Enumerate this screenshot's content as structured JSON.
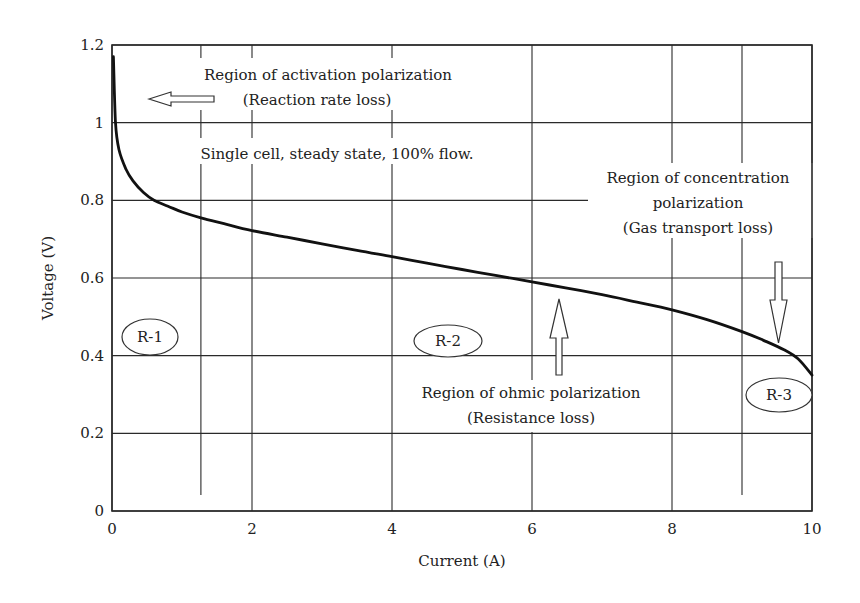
{
  "chart_data": {
    "type": "line",
    "title": "",
    "xlabel": "Current (A)",
    "ylabel": "Voltage (V)",
    "xlim": [
      0,
      10
    ],
    "ylim": [
      0,
      1.2
    ],
    "xticks": [
      0,
      2,
      4,
      6,
      8,
      10
    ],
    "xtick_labels": [
      "0",
      "2",
      "4",
      "6",
      "8",
      "10"
    ],
    "yticks": [
      0,
      0.2,
      0.4,
      0.6,
      0.8,
      1.0,
      1.2
    ],
    "ytick_labels": [
      "0",
      "0.2",
      "0.4",
      "0.6",
      "0.8",
      "1",
      "1.2"
    ],
    "grid": true,
    "region_boundaries_x": [
      1.27,
      9.0
    ],
    "series": [
      {
        "name": "Polarization curve",
        "x": [
          0.02,
          0.05,
          0.1,
          0.2,
          0.3,
          0.45,
          0.6,
          0.8,
          1.0,
          1.27,
          1.6,
          2.0,
          2.5,
          3.0,
          3.5,
          4.0,
          4.5,
          5.0,
          5.5,
          6.0,
          6.5,
          7.0,
          7.5,
          8.0,
          8.5,
          9.0,
          9.3,
          9.6,
          9.8,
          10.0
        ],
        "y": [
          1.17,
          1.0,
          0.93,
          0.88,
          0.85,
          0.82,
          0.8,
          0.785,
          0.77,
          0.755,
          0.74,
          0.722,
          0.705,
          0.688,
          0.671,
          0.655,
          0.638,
          0.622,
          0.606,
          0.59,
          0.574,
          0.557,
          0.538,
          0.518,
          0.493,
          0.462,
          0.44,
          0.415,
          0.392,
          0.35
        ]
      }
    ],
    "annotations": [
      {
        "id": "activation",
        "lines": [
          "Region of activation polarization",
          "(Reaction rate loss)"
        ],
        "arrow": "left"
      },
      {
        "id": "conditions",
        "lines": [
          "Single cell, steady state, 100% flow."
        ]
      },
      {
        "id": "concentration",
        "lines": [
          "Region of concentration",
          "polarization",
          "(Gas transport loss)"
        ],
        "arrow": "down"
      },
      {
        "id": "ohmic",
        "lines": [
          "Region of ohmic polarization",
          "(Resistance loss)"
        ],
        "arrow": "up"
      }
    ],
    "region_labels": [
      "R-1",
      "R-2",
      "R-3"
    ]
  },
  "labels": {
    "activation_1": "Region of activation polarization",
    "activation_2": "(Reaction rate loss)",
    "conditions": "Single cell, steady state, 100% flow.",
    "concentration_1": "Region of concentration",
    "concentration_2": "polarization",
    "concentration_3": "(Gas transport loss)",
    "ohmic_1": "Region of ohmic polarization",
    "ohmic_2": "(Resistance loss)",
    "r1": "R-1",
    "r2": "R-2",
    "r3": "R-3"
  }
}
